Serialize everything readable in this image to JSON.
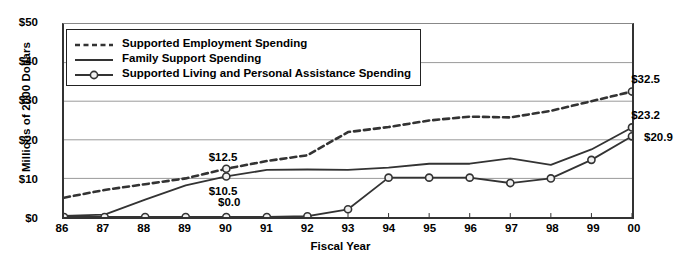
{
  "chart_data": {
    "type": "line",
    "title": "",
    "xlabel": "Fiscal Year",
    "ylabel": "Millions of 2000 Dollars",
    "categories": [
      "86",
      "87",
      "88",
      "89",
      "90",
      "91",
      "92",
      "93",
      "94",
      "95",
      "96",
      "97",
      "98",
      "99",
      "00"
    ],
    "ylim": [
      0,
      50
    ],
    "yticks": [
      0,
      10,
      20,
      30,
      40,
      50
    ],
    "ytick_labels": [
      "$0",
      "$10",
      "$20",
      "$30",
      "$40",
      "$50"
    ],
    "grid": "horizontal",
    "legend_position": "top-left-inside",
    "series": [
      {
        "name": "Supported Employment Spending",
        "style": "dashed",
        "marker": "none",
        "color": "#333333",
        "values": [
          5.0,
          7.0,
          8.5,
          10.0,
          12.5,
          14.5,
          16.0,
          22.0,
          23.3,
          25.0,
          26.0,
          25.8,
          27.5,
          30.0,
          32.5
        ]
      },
      {
        "name": "Family Support Spending",
        "style": "solid",
        "marker": "none",
        "color": "#333333",
        "values": [
          0.3,
          0.6,
          4.5,
          8.2,
          10.5,
          12.2,
          12.3,
          12.2,
          12.8,
          13.8,
          13.8,
          15.2,
          13.5,
          17.5,
          23.2
        ]
      },
      {
        "name": "Supported Living and Personal Assistance Spending",
        "style": "solid",
        "marker": "circle",
        "color": "#333333",
        "values": [
          0.0,
          0.0,
          0.0,
          0.0,
          0.0,
          0.0,
          0.2,
          2.0,
          10.2,
          10.2,
          10.2,
          8.8,
          10.0,
          14.8,
          20.9
        ]
      }
    ],
    "annotations": [
      {
        "text": "$12.5",
        "year": "90",
        "value": 12.5,
        "series": "Supported Employment Spending",
        "dx": -20,
        "dy": -19
      },
      {
        "text": "$10.5",
        "year": "90",
        "value": 10.5,
        "series": "Family Support Spending",
        "dx": -20,
        "dy": 7
      },
      {
        "text": "$0.0",
        "year": "90",
        "value": 0.0,
        "series": "Supported Living and Personal Assistance Spending",
        "dx": -17,
        "dy": -23
      },
      {
        "text": "$32.5",
        "year": "00",
        "value": 32.5,
        "series": "Supported Employment Spending",
        "dx": -6,
        "dy": -19
      },
      {
        "text": "$23.2",
        "year": "00",
        "value": 23.2,
        "series": "Family Support Spending",
        "dx": -6,
        "dy": -19
      },
      {
        "text": "$20.9",
        "year": "00",
        "value": 20.9,
        "series": "Supported Living and Personal Assistance Spending",
        "dx": 10,
        "dy": -6
      }
    ]
  },
  "legend": {
    "items": [
      {
        "label": "Supported Employment Spending",
        "symbol": "dashed-line-swatch"
      },
      {
        "label": "Family Support Spending",
        "symbol": "solid-line-swatch"
      },
      {
        "label": "Supported Living and Personal Assistance Spending",
        "symbol": "solid-line-circle-marker-swatch"
      }
    ]
  }
}
